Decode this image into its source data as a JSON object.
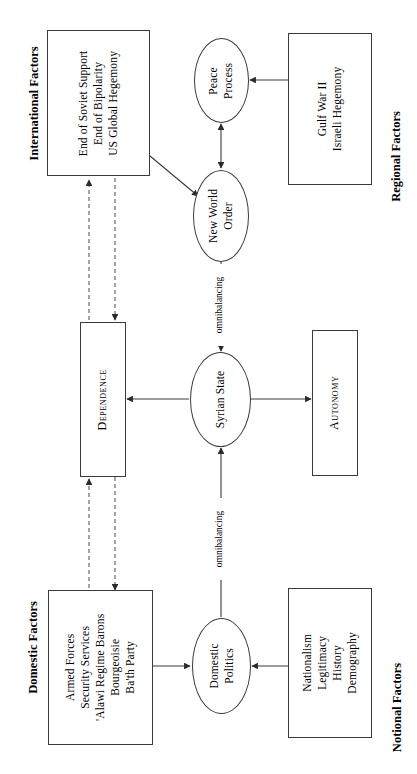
{
  "diagram": {
    "orientation": "rotated-90-ccw",
    "group_labels": {
      "international": "International Factors",
      "regional": "Regional Factors",
      "domestic": "Domestic Factors",
      "notional": "Notional Factors"
    },
    "nodes": {
      "international_factors": {
        "shape": "box",
        "lines": [
          "End of Soviet Support",
          "End of Bipolarity",
          "US Global Hegemony"
        ]
      },
      "regional_factors": {
        "shape": "box",
        "lines": [
          "Gulf War II",
          "Israeli Hegemony"
        ]
      },
      "domestic_factors": {
        "shape": "box",
        "lines": [
          "Armed Forces",
          "Security Services",
          "'Alawi Regime Barons",
          "Bourgeoisie",
          "Ba'th Party"
        ]
      },
      "notional_factors": {
        "shape": "box",
        "lines": [
          "Nationalism",
          "Legitimacy",
          "History",
          "Demography"
        ]
      },
      "dependence": {
        "shape": "box",
        "label": "Dependence"
      },
      "autonomy": {
        "shape": "box",
        "label": "Autonomy"
      },
      "peace_process": {
        "shape": "ellipse",
        "lines": [
          "Peace",
          "Process"
        ]
      },
      "new_world_order": {
        "shape": "ellipse",
        "lines": [
          "New World",
          "Order"
        ]
      },
      "syrian_state": {
        "shape": "ellipse",
        "lines": [
          "Syrian State"
        ]
      },
      "domestic_politics": {
        "shape": "ellipse",
        "lines": [
          "Domestic",
          "Politics"
        ]
      }
    },
    "edge_labels": {
      "omnibalancing_upper": "omnibalancing",
      "omnibalancing_lower": "omnibalancing"
    },
    "colors": {
      "stroke": "#3a3a3a",
      "text": "#000000",
      "background": "#ffffff",
      "dashed_stroke": "#5a5a5a"
    }
  }
}
